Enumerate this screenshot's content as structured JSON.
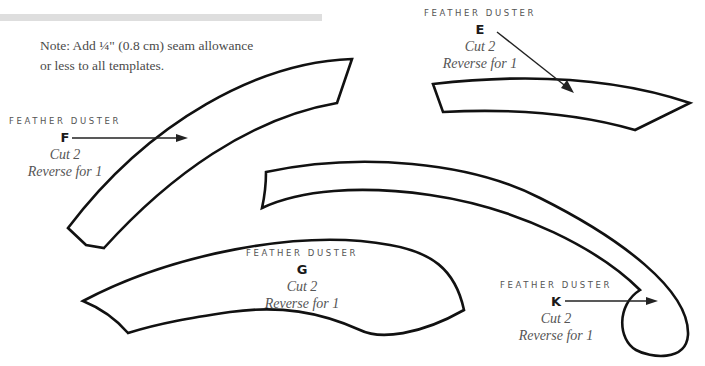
{
  "note": {
    "line1": "Note: Add ¼\" (0.8 cm) seam allowance",
    "line2": "or less to all templates."
  },
  "pieces": {
    "E": {
      "title": "FEATHER DUSTER",
      "letter": "E",
      "cut": "Cut 2",
      "reverse": "Reverse for 1"
    },
    "F": {
      "title": "FEATHER DUSTER",
      "letter": "F",
      "cut": "Cut 2",
      "reverse": "Reverse for 1"
    },
    "G": {
      "title": "FEATHER DUSTER",
      "letter": "G",
      "cut": "Cut 2",
      "reverse": "Reverse for 1"
    },
    "K": {
      "title": "FEATHER DUSTER",
      "letter": "K",
      "cut": "Cut 2",
      "reverse": "Reverse for 1"
    }
  },
  "colors": {
    "outline": "#111111",
    "bar": "#dedede",
    "text": "#4a4a4a"
  }
}
